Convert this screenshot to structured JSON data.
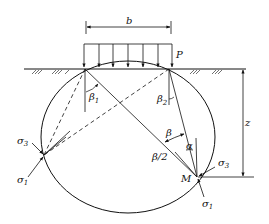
{
  "diagram": {
    "type": "soil stress under strip load",
    "labels": {
      "width": "b",
      "load": "P",
      "depth": "z",
      "beta1": "β",
      "beta1_sub": "1",
      "beta2": "β",
      "beta2_sub": "2",
      "beta": "β",
      "beta_half": "β/2",
      "alpha": "α",
      "point": "M",
      "sigma1_left": "σ",
      "sigma1_left_sub": "1",
      "sigma3_left": "σ",
      "sigma3_left_sub": "3",
      "sigma1_right": "σ",
      "sigma1_right_sub": "1",
      "sigma3_right": "σ",
      "sigma3_right_sub": "3"
    },
    "colors": {
      "line": "#111111",
      "background": "#ffffff"
    }
  }
}
